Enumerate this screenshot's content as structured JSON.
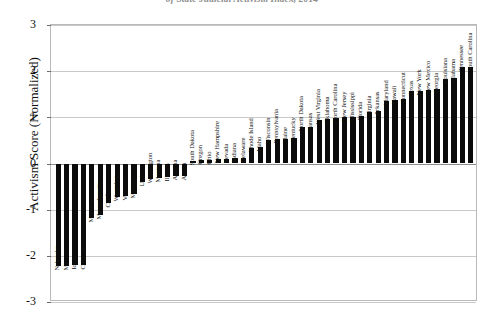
{
  "chart": {
    "title": "of State Judicial Activism Index, 2014",
    "ylabel": "Activism Score (Normalized)"
  },
  "chart_data": {
    "type": "bar",
    "title": "of State Judicial Activism Index, 2014",
    "xlabel": "",
    "ylabel": "Activism Score (Normalized)",
    "ylim": [
      -3,
      3
    ],
    "yticks": [
      3,
      2,
      1,
      0,
      -1,
      -2,
      -3
    ],
    "ytick_labels": [
      "3",
      "2",
      "1",
      "0",
      "-1",
      "-2",
      "-3"
    ],
    "grid": true,
    "legend": false,
    "bar_color": "#0b0b0b",
    "orientation": "vertical",
    "sorted": "ascending",
    "categories": [
      "Nebraska",
      "Minnesota",
      "Iowa",
      "Colorado",
      "Missouri",
      "Massachusetts",
      "California",
      "Wyoming",
      "Vermont",
      "Michigan",
      "Utah",
      "Washington",
      "Montana",
      "Illinois",
      "Arizona",
      "Alaska",
      "South Dakota",
      "Oregon",
      "Ohio",
      "New Hampshire",
      "Nevada",
      "Indiana",
      "Delaware",
      "Rhode Island",
      "Idaho",
      "Wisconsin",
      "Pennsylvania",
      "Maine",
      "Kentucky",
      "North Dakota",
      "Kansas",
      "West Virginia",
      "Oklahoma",
      "North Carolina",
      "New Jersey",
      "Mississippi",
      "Florida",
      "Virginia",
      "Arkansas",
      "Maryland",
      "Hawaii",
      "Connecticut",
      "Texas",
      "New York",
      "New Mexico",
      "Georgia",
      "Louisiana",
      "Alabama",
      "Tennessee",
      "South Carolina"
    ],
    "values": [
      -2.22,
      -2.22,
      -2.2,
      -2.2,
      -1.18,
      -1.12,
      -0.86,
      -0.72,
      -0.7,
      -0.66,
      -0.4,
      -0.34,
      -0.32,
      -0.3,
      -0.28,
      -0.26,
      0.06,
      0.07,
      0.08,
      0.09,
      0.1,
      0.11,
      0.12,
      0.34,
      0.35,
      0.5,
      0.52,
      0.54,
      0.56,
      0.78,
      0.8,
      0.94,
      0.96,
      0.98,
      1.0,
      1.01,
      1.02,
      1.12,
      1.14,
      1.36,
      1.38,
      1.4,
      1.56,
      1.58,
      1.6,
      1.62,
      1.84,
      1.86,
      2.1,
      2.1
    ]
  }
}
